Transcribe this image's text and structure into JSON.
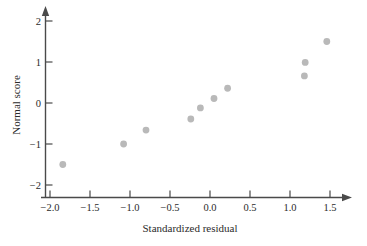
{
  "chart_data": {
    "type": "scatter",
    "title": "",
    "xlabel": "Standardized residual",
    "ylabel": "Normal score",
    "xlim": [
      -2.0,
      1.6
    ],
    "ylim": [
      -2.3,
      2.3
    ],
    "grid": false,
    "legend": "none",
    "xticks": [
      -2.0,
      -1.5,
      -1.0,
      -0.5,
      0.0,
      0.5,
      1.0,
      1.5
    ],
    "xtick_labels": [
      "−2.0",
      "−1.5",
      "−1.0",
      "−0.5",
      "0.0",
      "0.5",
      "1.0",
      "1.5"
    ],
    "yticks": [
      -2,
      -1,
      0,
      1,
      2
    ],
    "ytick_labels": [
      "−2",
      "−1",
      "0",
      "1",
      "2"
    ],
    "marker": {
      "shape": "circle",
      "color": "#b9b9b9",
      "size": 3.4
    },
    "points": [
      {
        "x": -1.84,
        "y": -1.5
      },
      {
        "x": -1.08,
        "y": -1.0
      },
      {
        "x": -0.8,
        "y": -0.66
      },
      {
        "x": -0.24,
        "y": -0.39
      },
      {
        "x": -0.12,
        "y": -0.12
      },
      {
        "x": 0.05,
        "y": 0.11
      },
      {
        "x": 0.22,
        "y": 0.36
      },
      {
        "x": 1.18,
        "y": 0.66
      },
      {
        "x": 1.19,
        "y": 0.99
      },
      {
        "x": 1.46,
        "y": 1.5
      }
    ],
    "x_values": [
      -1.84,
      -1.08,
      -0.8,
      -0.24,
      -0.12,
      0.05,
      0.22,
      1.18,
      1.19,
      1.46
    ],
    "y_values": [
      -1.5,
      -1.0,
      -0.66,
      -0.39,
      -0.12,
      0.11,
      0.36,
      0.66,
      0.99,
      1.5
    ],
    "colors": {
      "axis": "#4a4a4a",
      "text": "#2b2b2b",
      "marker": "#b9b9b9",
      "background": "#ffffff"
    }
  }
}
